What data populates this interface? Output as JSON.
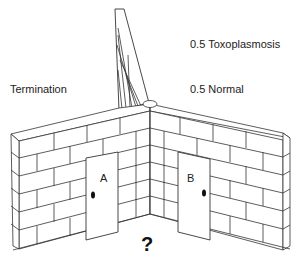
{
  "diagram": {
    "type": "decision-tree-maze-illustration",
    "labels": {
      "termination": "Termination",
      "branch_toxo": "0.5 Toxoplasmosis",
      "branch_normal": "0.5 Normal",
      "question": "?"
    },
    "doors": [
      {
        "id": "A",
        "label": "A"
      },
      {
        "id": "B",
        "label": "B"
      }
    ],
    "colors": {
      "line": "#333333",
      "fill": "#ffffff",
      "text": "#222222"
    }
  }
}
